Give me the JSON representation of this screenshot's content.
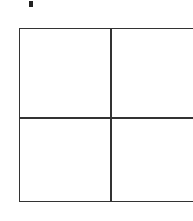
{
  "figure": {
    "type": "2x2 grid",
    "rows": 2,
    "columns": 2,
    "cells": [
      {
        "row": 1,
        "col": 1,
        "content": ""
      },
      {
        "row": 1,
        "col": 2,
        "content": ""
      },
      {
        "row": 2,
        "col": 1,
        "content": ""
      },
      {
        "row": 2,
        "col": 2,
        "content": ""
      }
    ],
    "line_color": "#333333"
  }
}
